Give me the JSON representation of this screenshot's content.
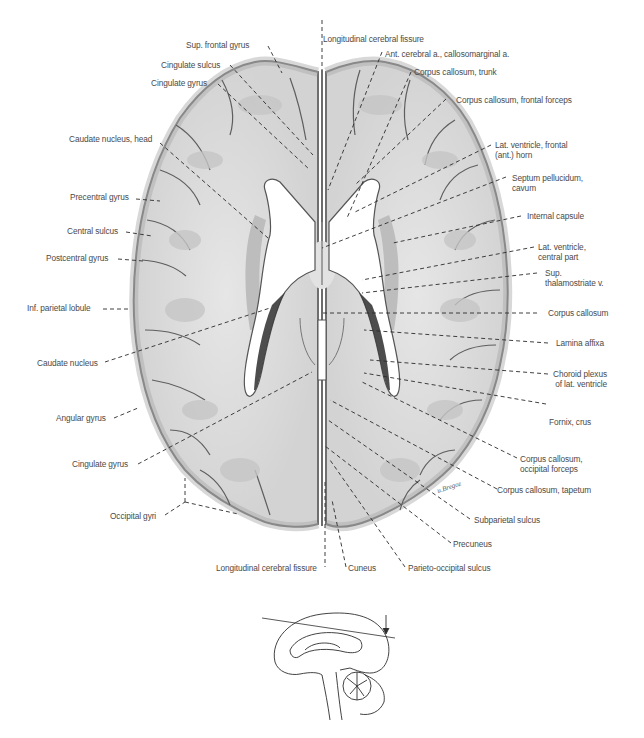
{
  "figure": {
    "colors": {
      "background": "#ffffff",
      "brain_tissue": "#d6d6d6",
      "white_matter": "#e4e4e4",
      "cortex_edge": "#8a8a8a",
      "ventricle": "#ffffff",
      "choroid_plexus": "#3a3a3a",
      "leader_line": "#2b2b2b",
      "label_text": "#4a4a4a"
    },
    "labels_left": [
      {
        "id": "sup-frontal-gyrus",
        "text": "Sup. frontal gyrus"
      },
      {
        "id": "cingulate-sulcus",
        "text": "Cingulate sulcus"
      },
      {
        "id": "cingulate-gyrus-top",
        "text": "Cingulate gyrus"
      },
      {
        "id": "caudate-nucleus-head",
        "text": "Caudate nucleus, head"
      },
      {
        "id": "precentral-gyrus",
        "text": "Precentral gyrus"
      },
      {
        "id": "central-sulcus",
        "text": "Central sulcus"
      },
      {
        "id": "postcentral-gyrus",
        "text": "Postcentral gyrus"
      },
      {
        "id": "inf-parietal-lobule",
        "text": "Inf. parietal lobule"
      },
      {
        "id": "caudate-nucleus",
        "text": "Caudate nucleus"
      },
      {
        "id": "angular-gyrus",
        "text": "Angular gyrus"
      },
      {
        "id": "cingulate-gyrus-bottom",
        "text": "Cingulate gyrus"
      },
      {
        "id": "occipital-gyri",
        "text": "Occipital gyri"
      }
    ],
    "labels_top": [
      {
        "id": "longitudinal-cerebral-fissure-top",
        "text": "Longitudinal cerebral fissure"
      }
    ],
    "labels_right": [
      {
        "id": "ant-cerebral-a",
        "text": "Ant. cerebral a., callosomarginal a."
      },
      {
        "id": "corpus-callosum-trunk",
        "text": "Corpus callosum, trunk"
      },
      {
        "id": "corpus-callosum-frontal-forceps",
        "text": "Corpus callosum, frontal forceps"
      },
      {
        "id": "lat-ventricle-frontal-horn",
        "line1": "Lat. ventricle, frontal",
        "line2": "(ant.) horn"
      },
      {
        "id": "septum-pellucidum-cavum",
        "line1": "Septum pellucidum,",
        "line2": "cavum"
      },
      {
        "id": "internal-capsule",
        "text": "Internal capsule"
      },
      {
        "id": "lat-ventricle-central-part",
        "line1": "Lat. ventricle,",
        "line2": "central part"
      },
      {
        "id": "sup-thalamostriate-v",
        "line1": "Sup.",
        "line2": "thalamostriate v."
      },
      {
        "id": "corpus-callosum",
        "text": "Corpus callosum"
      },
      {
        "id": "lamina-affixa",
        "text": "Lamina affixa"
      },
      {
        "id": "choroid-plexus",
        "line1": "Choroid plexus",
        "line2": "of lat. ventricle"
      },
      {
        "id": "fornix-crus",
        "text": "Fornix, crus"
      },
      {
        "id": "corpus-callosum-occipital-forceps",
        "line1": "Corpus callosum,",
        "line2": "occipital forceps"
      },
      {
        "id": "corpus-callosum-tapetum",
        "text": "Corpus callosum, tapetum"
      },
      {
        "id": "subparietal-sulcus",
        "text": "Subparietal sulcus"
      },
      {
        "id": "precuneus",
        "text": "Precuneus"
      },
      {
        "id": "parieto-occipital-sulcus",
        "text": "Parieto-occipital sulcus"
      }
    ],
    "labels_bottom": [
      {
        "id": "longitudinal-cerebral-fissure-bottom",
        "text": "Longitudinal cerebral fissure"
      },
      {
        "id": "cuneus",
        "text": "Cuneus"
      }
    ],
    "inset": {
      "description": "Midsagittal brain orientation sketch with oblique section plane line and viewing-direction arrow",
      "arrow_icon": "down-arrow-icon"
    }
  }
}
